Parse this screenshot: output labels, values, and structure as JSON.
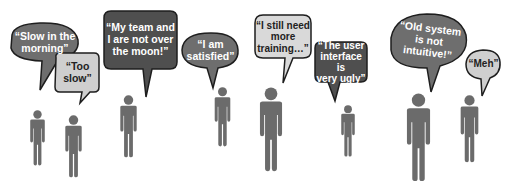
{
  "colors": {
    "background": "#ffffff",
    "dark_bubble": "#5a5a5a",
    "mid_bubble": "#6e6e6e",
    "light_bubble": "#cfcfcf",
    "outline": "#1e1e1e",
    "figure": "#6b6b6b"
  },
  "bubbles": [
    {
      "id": "slow-morning",
      "text": "“Slow in the\nmorning”",
      "style": "mid"
    },
    {
      "id": "too-slow",
      "text": "“Too\nslow”",
      "style": "light"
    },
    {
      "id": "not-over-moon",
      "text": "“My team and\nI are not over\nthe moon!”",
      "style": "dark"
    },
    {
      "id": "satisfied",
      "text": "“I am\nsatisfied”",
      "style": "mid"
    },
    {
      "id": "need-training",
      "text": "“I still need\nmore\ntraining…”",
      "style": "light"
    },
    {
      "id": "ui-ugly",
      "text": "“The user\ninterface is\nvery ugly”",
      "style": "dark"
    },
    {
      "id": "old-system",
      "text": "“Old system\nis not\nintuitive!”",
      "style": "mid"
    },
    {
      "id": "meh",
      "text": "“Meh”",
      "style": "light"
    }
  ],
  "figures": [
    {
      "id": "person-1"
    },
    {
      "id": "person-2"
    },
    {
      "id": "person-3"
    },
    {
      "id": "person-4"
    },
    {
      "id": "person-5"
    },
    {
      "id": "person-6"
    },
    {
      "id": "person-7"
    },
    {
      "id": "person-8"
    }
  ]
}
